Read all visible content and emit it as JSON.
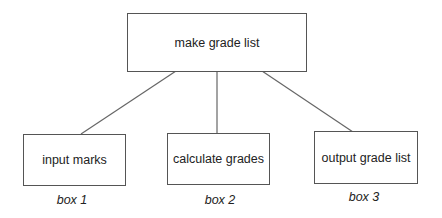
{
  "diagram": {
    "type": "hierarchy-chart",
    "root": {
      "label": "make grade list"
    },
    "children": [
      {
        "label": "input marks",
        "caption": "box 1"
      },
      {
        "label": "calculate grades",
        "caption": "box 2"
      },
      {
        "label": "output grade list",
        "caption": "box 3"
      }
    ],
    "colors": {
      "stroke": "#555555",
      "text": "#222222",
      "background": "#ffffff"
    }
  }
}
